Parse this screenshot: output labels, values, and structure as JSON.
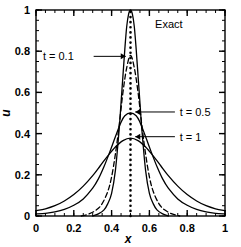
{
  "chart_data": {
    "type": "line",
    "title": "",
    "xlabel": "x",
    "ylabel": "u",
    "xlim": [
      0,
      1
    ],
    "ylim": [
      0,
      1
    ],
    "grid": false,
    "legend_position": "inline-annotations",
    "xticks": [
      "0",
      "0.2",
      "0.4",
      "0.6",
      "0.8",
      "1"
    ],
    "xtick_values": [
      0,
      0.2,
      0.4,
      0.6,
      0.8,
      1
    ],
    "yticks": [
      "0",
      "0.2",
      "0.4",
      "0.6",
      "0.8",
      "1"
    ],
    "ytick_values": [
      0,
      0.2,
      0.4,
      0.6,
      0.8,
      1
    ],
    "minor_tick_step": 0.05,
    "annotations": [
      {
        "label": "Exact",
        "x": 0.63,
        "y": 0.93
      },
      {
        "label": "t = 0.1",
        "x": 0.2,
        "y": 0.775
      },
      {
        "label": "t = 0.5",
        "x": 0.76,
        "y": 0.505
      },
      {
        "label": "t = 1",
        "x": 0.76,
        "y": 0.385
      }
    ],
    "series": [
      {
        "name": "Exact",
        "style": "dotted-vertical",
        "x": [
          0.5,
          0.5
        ],
        "values": [
          0,
          1
        ]
      },
      {
        "name": "t = 0.1 (numerical, solid)",
        "style": "solid",
        "x": [
          0.3,
          0.33,
          0.36,
          0.38,
          0.4,
          0.42,
          0.44,
          0.45,
          0.46,
          0.47,
          0.48,
          0.49,
          0.5,
          0.51,
          0.52,
          0.53,
          0.54,
          0.55,
          0.56,
          0.58,
          0.6,
          0.62,
          0.64,
          0.67,
          0.7
        ],
        "values": [
          0.0,
          0.01,
          0.03,
          0.06,
          0.11,
          0.22,
          0.42,
          0.55,
          0.68,
          0.81,
          0.92,
          0.98,
          1.0,
          0.98,
          0.92,
          0.81,
          0.68,
          0.55,
          0.42,
          0.22,
          0.11,
          0.06,
          0.03,
          0.01,
          0.0
        ]
      },
      {
        "name": "t = 0.1 (dashed)",
        "style": "dashed",
        "x": [
          0.24,
          0.28,
          0.32,
          0.35,
          0.38,
          0.4,
          0.42,
          0.44,
          0.46,
          0.48,
          0.5,
          0.52,
          0.54,
          0.56,
          0.58,
          0.6,
          0.62,
          0.65,
          0.68,
          0.72,
          0.76
        ],
        "values": [
          0.0,
          0.01,
          0.03,
          0.06,
          0.12,
          0.19,
          0.3,
          0.44,
          0.6,
          0.72,
          0.78,
          0.72,
          0.6,
          0.44,
          0.3,
          0.19,
          0.12,
          0.06,
          0.03,
          0.01,
          0.0
        ]
      },
      {
        "name": "t = 0.5",
        "style": "solid",
        "x": [
          0.0,
          0.05,
          0.1,
          0.15,
          0.2,
          0.25,
          0.3,
          0.33,
          0.36,
          0.39,
          0.42,
          0.45,
          0.47,
          0.5,
          0.53,
          0.55,
          0.58,
          0.61,
          0.64,
          0.67,
          0.7,
          0.75,
          0.8,
          0.85,
          0.9,
          0.95,
          1.0
        ],
        "values": [
          0.01,
          0.013,
          0.02,
          0.032,
          0.052,
          0.083,
          0.135,
          0.18,
          0.24,
          0.31,
          0.385,
          0.455,
          0.487,
          0.5,
          0.487,
          0.455,
          0.385,
          0.31,
          0.24,
          0.18,
          0.135,
          0.083,
          0.052,
          0.032,
          0.02,
          0.013,
          0.01
        ]
      },
      {
        "name": "t = 1",
        "style": "solid",
        "x": [
          0.0,
          0.05,
          0.1,
          0.15,
          0.2,
          0.25,
          0.3,
          0.34,
          0.38,
          0.42,
          0.46,
          0.5,
          0.54,
          0.58,
          0.62,
          0.66,
          0.7,
          0.75,
          0.8,
          0.85,
          0.9,
          0.95,
          1.0
        ],
        "values": [
          0.026,
          0.035,
          0.05,
          0.073,
          0.104,
          0.145,
          0.196,
          0.244,
          0.292,
          0.335,
          0.366,
          0.378,
          0.366,
          0.335,
          0.292,
          0.244,
          0.196,
          0.145,
          0.104,
          0.073,
          0.05,
          0.035,
          0.026
        ]
      }
    ]
  }
}
